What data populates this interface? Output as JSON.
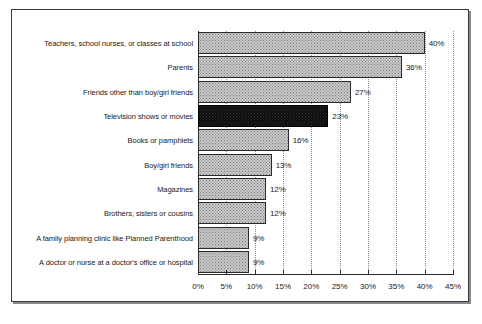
{
  "chart_data": {
    "type": "bar",
    "orientation": "horizontal",
    "title": "",
    "subtitle": "",
    "xlabel": "",
    "ylabel": "",
    "xlim": [
      0,
      45
    ],
    "grid": true,
    "legend": false,
    "categories": [
      "Teachers, school nurses, or classes at school",
      "Parents",
      "Friends other than boy/girl friends",
      "Television shows or movies",
      "Books or pamphlets",
      "Boy/girl friends",
      "Magazines",
      "Brothers, sisters or cousins",
      "A family planning clinic like Planned Parenthood",
      "A doctor or nurse at a doctor's office or hospital"
    ],
    "values": [
      40,
      36,
      27,
      23,
      16,
      13,
      12,
      12,
      9,
      9
    ],
    "value_labels": [
      "40%",
      "36%",
      "27%",
      "23%",
      "16%",
      "13%",
      "12%",
      "12%",
      "9%",
      "9%"
    ],
    "highlight_index": 3,
    "tick_values": [
      0,
      5,
      10,
      15,
      20,
      25,
      30,
      35,
      40,
      45
    ],
    "tick_labels": [
      "0%",
      "5%",
      "10%",
      "15%",
      "20%",
      "25%",
      "30%",
      "35%",
      "40%",
      "45%"
    ],
    "colors": {
      "bar_fill": "#c9c9c9",
      "bar_highlight": "#0d0d0d",
      "bar_border": "#2b2b2b",
      "axis": "#2b2b2b",
      "grid": "#8d8d8d",
      "text": "#1a1a1a",
      "frame": "#3a3a3a"
    }
  },
  "caption": {
    "mark": ""
  }
}
